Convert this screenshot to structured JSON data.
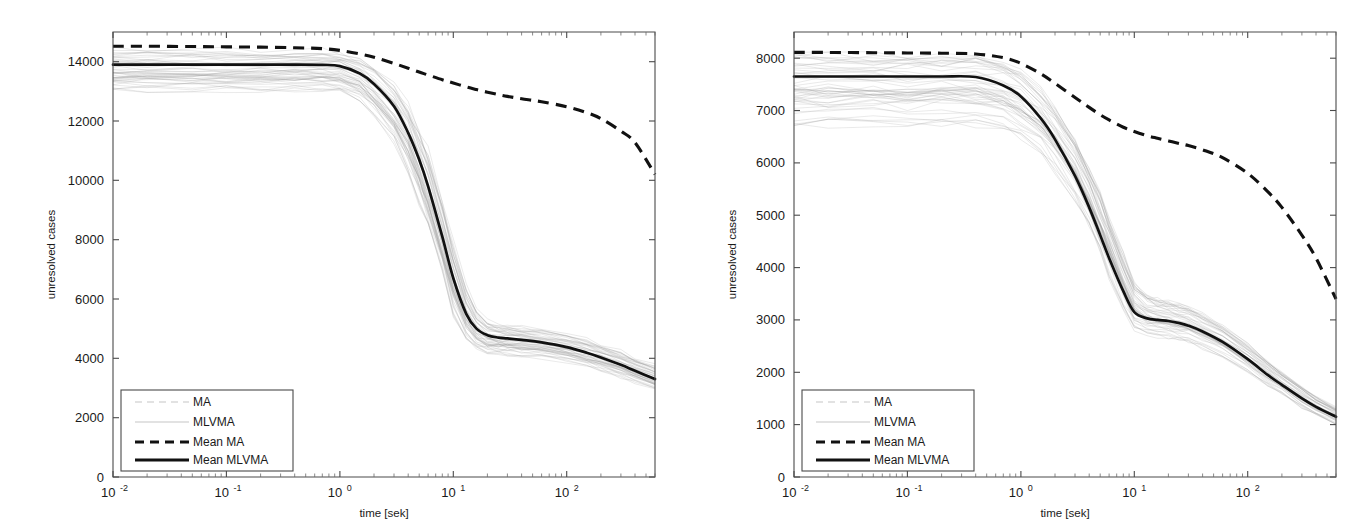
{
  "figure": {
    "background": "#ffffff",
    "panel_count": 2,
    "mean_color": "#111111",
    "ensemble_color": "#9a9a9a"
  },
  "panels": [
    {
      "id": "left-panel",
      "ylabel": "unresolved cases",
      "xlabel": "time [sek]",
      "y_ticks": [
        "0",
        "2000",
        "4000",
        "6000",
        "8000",
        "10000",
        "12000",
        "14000"
      ],
      "x_ticks": [
        {
          "mantissa": "10",
          "exponent": "-2"
        },
        {
          "mantissa": "10",
          "exponent": "-1"
        },
        {
          "mantissa": "10",
          "exponent": "0"
        },
        {
          "mantissa": "10",
          "exponent": "1"
        },
        {
          "mantissa": "10",
          "exponent": "2"
        }
      ],
      "legend": [
        {
          "label": "MA",
          "style": "faint-dashed"
        },
        {
          "label": "MLVMA",
          "style": "faint-solid"
        },
        {
          "label": "Mean MA",
          "style": "dashed"
        },
        {
          "label": "Mean MLVMA",
          "style": "solid"
        }
      ]
    },
    {
      "id": "right-panel",
      "ylabel": "unresolved cases",
      "xlabel": "time [sek]",
      "y_ticks": [
        "0",
        "1000",
        "2000",
        "3000",
        "4000",
        "5000",
        "6000",
        "7000",
        "8000"
      ],
      "x_ticks": [
        {
          "mantissa": "10",
          "exponent": "-2"
        },
        {
          "mantissa": "10",
          "exponent": "-1"
        },
        {
          "mantissa": "10",
          "exponent": "0"
        },
        {
          "mantissa": "10",
          "exponent": "1"
        },
        {
          "mantissa": "10",
          "exponent": "2"
        }
      ],
      "legend": [
        {
          "label": "MA",
          "style": "faint-dashed"
        },
        {
          "label": "MLVMA",
          "style": "faint-solid"
        },
        {
          "label": "Mean MA",
          "style": "dashed"
        },
        {
          "label": "Mean MLVMA",
          "style": "solid"
        }
      ]
    }
  ],
  "chart_data": [
    {
      "type": "line",
      "title": "",
      "panel": "left",
      "xlabel": "time [sek]",
      "ylabel": "unresolved cases",
      "xscale": "log",
      "yscale": "linear",
      "xlim": [
        0.01,
        600
      ],
      "ylim": [
        0,
        15000
      ],
      "yticks": [
        0,
        2000,
        4000,
        6000,
        8000,
        10000,
        12000,
        14000
      ],
      "xticks": [
        0.01,
        0.1,
        1,
        10,
        100
      ],
      "grid": false,
      "legend_position": "lower left",
      "x": [
        0.01,
        0.02,
        0.05,
        0.1,
        0.2,
        0.4,
        0.7,
        1.0,
        1.5,
        2.0,
        3.0,
        4.0,
        5.0,
        6.0,
        8.0,
        10.0,
        13.0,
        16.0,
        20.0,
        25.0,
        30.0,
        40.0,
        60.0,
        100.0,
        150.0,
        200.0,
        300.0,
        400.0,
        600.0
      ],
      "series": [
        {
          "name": "Mean MA",
          "style": "dashed",
          "color": "#111111",
          "values": [
            14520,
            14520,
            14510,
            14500,
            14490,
            14470,
            14440,
            14380,
            14260,
            14150,
            13940,
            13780,
            13650,
            13550,
            13390,
            13280,
            13150,
            13060,
            12970,
            12890,
            12830,
            12750,
            12650,
            12480,
            12280,
            12080,
            11660,
            11270,
            10200
          ]
        },
        {
          "name": "Mean MLVMA",
          "style": "solid",
          "color": "#111111",
          "values": [
            13900,
            13900,
            13900,
            13900,
            13900,
            13900,
            13890,
            13850,
            13600,
            13250,
            12500,
            11600,
            10700,
            9800,
            8100,
            6700,
            5500,
            5000,
            4780,
            4700,
            4670,
            4620,
            4540,
            4380,
            4190,
            4030,
            3780,
            3580,
            3300
          ]
        },
        {
          "name": "MLVMA ensemble upper",
          "style": "faint",
          "color": "#9a9a9a",
          "values": [
            14450,
            14450,
            14450,
            14450,
            14450,
            14450,
            14440,
            14400,
            14250,
            13950,
            13400,
            12700,
            11900,
            11100,
            9500,
            8000,
            6500,
            5700,
            5300,
            5200,
            5170,
            5120,
            5040,
            4880,
            4690,
            4530,
            4280,
            4080,
            3820
          ]
        },
        {
          "name": "MLVMA ensemble lower",
          "style": "faint",
          "color": "#9a9a9a",
          "values": [
            13050,
            13050,
            13050,
            13050,
            13050,
            13050,
            13040,
            13000,
            12700,
            12200,
            11300,
            10300,
            9300,
            8400,
            6800,
            5500,
            4600,
            4300,
            4180,
            4150,
            4130,
            4100,
            4040,
            3900,
            3740,
            3600,
            3380,
            3200,
            2950
          ]
        }
      ],
      "annotations": {
        "mean_mlvma_plateau_value": 4700,
        "mean_mlvma_start_value": 13900,
        "mean_mlvma_end_value": 3300,
        "mean_ma_start_value": 14520,
        "mean_ma_end_value": 10200
      }
    },
    {
      "type": "line",
      "title": "",
      "panel": "right",
      "xlabel": "time [sek]",
      "ylabel": "unresolved cases",
      "xscale": "log",
      "yscale": "linear",
      "xlim": [
        0.01,
        600
      ],
      "ylim": [
        0,
        8500
      ],
      "yticks": [
        0,
        1000,
        2000,
        3000,
        4000,
        5000,
        6000,
        7000,
        8000
      ],
      "xticks": [
        0.01,
        0.1,
        1,
        10,
        100
      ],
      "grid": false,
      "legend_position": "lower left",
      "x": [
        0.01,
        0.02,
        0.05,
        0.1,
        0.2,
        0.4,
        0.7,
        1.0,
        1.5,
        2.0,
        3.0,
        4.0,
        5.0,
        6.0,
        8.0,
        10.0,
        13.0,
        16.0,
        20.0,
        25.0,
        30.0,
        40.0,
        60.0,
        100.0,
        150.0,
        200.0,
        300.0,
        400.0,
        600.0
      ],
      "series": [
        {
          "name": "Mean MA",
          "style": "dashed",
          "color": "#111111",
          "values": [
            8110,
            8110,
            8105,
            8100,
            8095,
            8080,
            8010,
            7900,
            7700,
            7520,
            7250,
            7060,
            6920,
            6820,
            6680,
            6600,
            6520,
            6470,
            6420,
            6370,
            6330,
            6250,
            6100,
            5800,
            5450,
            5150,
            4620,
            4180,
            3400
          ]
        },
        {
          "name": "Mean MLVMA",
          "style": "solid",
          "color": "#111111",
          "values": [
            7650,
            7650,
            7650,
            7650,
            7650,
            7640,
            7480,
            7270,
            6850,
            6450,
            5750,
            5150,
            4620,
            4180,
            3550,
            3150,
            3030,
            3000,
            2980,
            2940,
            2890,
            2780,
            2580,
            2250,
            1950,
            1760,
            1500,
            1340,
            1150
          ]
        },
        {
          "name": "MLVMA ensemble upper",
          "style": "faint",
          "color": "#9a9a9a",
          "values": [
            8060,
            8060,
            8060,
            8060,
            8060,
            8050,
            7930,
            7750,
            7400,
            7050,
            6450,
            5900,
            5400,
            4950,
            4250,
            3720,
            3480,
            3400,
            3350,
            3290,
            3230,
            3100,
            2880,
            2530,
            2210,
            2000,
            1720,
            1540,
            1330
          ]
        },
        {
          "name": "MLVMA ensemble lower",
          "style": "faint",
          "color": "#9a9a9a",
          "values": [
            6700,
            6700,
            6700,
            6700,
            6700,
            6690,
            6580,
            6430,
            6150,
            5850,
            5300,
            4750,
            4250,
            3800,
            3150,
            2780,
            2680,
            2660,
            2640,
            2600,
            2560,
            2460,
            2290,
            2000,
            1730,
            1560,
            1320,
            1170,
            990
          ]
        }
      ],
      "annotations": {
        "mean_mlvma_plateau_value": 3000,
        "mean_mlvma_start_value": 7650,
        "mean_mlvma_end_value": 1150,
        "mean_ma_start_value": 8110,
        "mean_ma_end_value": 3400
      }
    }
  ]
}
